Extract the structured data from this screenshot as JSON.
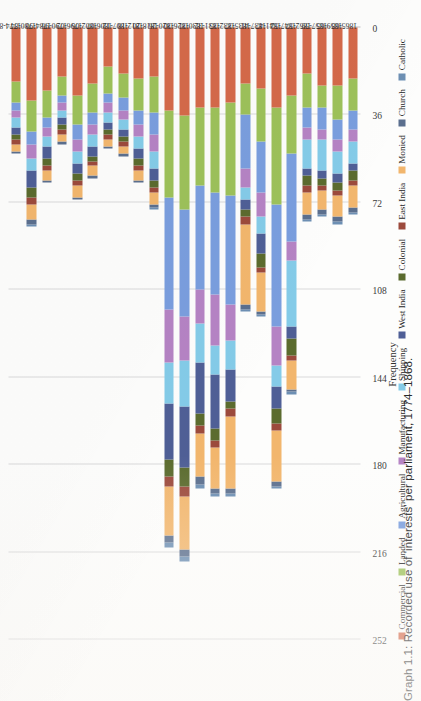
{
  "caption": "Graph 1.1: Recorded use of 'interests' per parliament, 1774–1868.",
  "chart_data": {
    "type": "bar",
    "subtype": "stacked-horizontal",
    "title": "",
    "xlabel": "",
    "ylabel": "Frequency",
    "orientation": "rotated-90",
    "grid": true,
    "legend_position": "bottom",
    "ylim": [
      0,
      252
    ],
    "yticks": [
      0,
      36,
      72,
      108,
      144,
      180,
      216,
      252
    ],
    "categories": [
      "1774-80",
      "1780-84",
      "1784-90",
      "1790-96",
      "1796-02",
      "1802-06",
      "1806-07",
      "1807-12",
      "1812-18",
      "1818-20",
      "1820-26",
      "1826-30",
      "1830-31",
      "1831-32",
      "1832-35",
      "1835-37",
      "1837-41",
      "1841-47",
      "1847-52",
      "1852-57",
      "1857-59",
      "1859-65",
      "1865-68"
    ],
    "series": [
      {
        "name": "Commercial",
        "color": "#d4694a",
        "values": [
          22,
          30,
          26,
          20,
          28,
          23,
          16,
          19,
          21,
          20,
          34,
          36,
          33,
          33,
          31,
          23,
          25,
          33,
          28,
          19,
          24,
          24,
          21
        ]
      },
      {
        "name": "Landed",
        "color": "#9dc15a",
        "values": [
          9,
          13,
          11,
          8,
          12,
          12,
          11,
          10,
          13,
          15,
          36,
          39,
          32,
          35,
          38,
          13,
          22,
          40,
          24,
          14,
          9,
          14,
          13
        ]
      },
      {
        "name": "Agricultural",
        "color": "#7a9ede",
        "values": [
          3,
          5,
          4,
          3,
          6,
          5,
          4,
          5,
          6,
          9,
          46,
          44,
          43,
          42,
          45,
          22,
          21,
          50,
          36,
          8,
          9,
          8,
          8
        ]
      },
      {
        "name": "Manufacturing",
        "color": "#b583c4",
        "values": [
          3,
          6,
          4,
          3,
          5,
          4,
          4,
          4,
          5,
          7,
          22,
          18,
          14,
          21,
          15,
          8,
          10,
          16,
          8,
          5,
          4,
          5,
          5
        ]
      },
      {
        "name": "Shipping",
        "color": "#84cbe8",
        "values": [
          4,
          5,
          4,
          3,
          5,
          5,
          4,
          4,
          5,
          7,
          17,
          19,
          16,
          12,
          12,
          5,
          7,
          9,
          27,
          12,
          13,
          9,
          9
        ]
      },
      {
        "name": "West India",
        "color": "#4f5f96",
        "values": [
          3,
          7,
          5,
          3,
          4,
          4,
          3,
          3,
          4,
          5,
          23,
          25,
          21,
          22,
          13,
          4,
          8,
          9,
          5,
          3,
          3,
          4,
          3
        ]
      },
      {
        "name": "Colonial",
        "color": "#5b6b2e",
        "values": [
          2,
          4,
          3,
          2,
          3,
          2,
          2,
          2,
          3,
          3,
          7,
          8,
          5,
          5,
          3,
          3,
          6,
          6,
          7,
          4,
          3,
          3,
          4
        ]
      },
      {
        "name": "East India",
        "color": "#9c4a3c",
        "values": [
          2,
          3,
          2,
          2,
          2,
          2,
          2,
          2,
          2,
          2,
          4,
          4,
          3,
          3,
          3,
          3,
          2,
          3,
          2,
          3,
          2,
          2,
          2
        ]
      },
      {
        "name": "Monied",
        "color": "#f2b66d",
        "values": [
          3,
          6,
          4,
          3,
          5,
          4,
          3,
          3,
          4,
          5,
          20,
          22,
          18,
          17,
          30,
          33,
          16,
          21,
          12,
          9,
          8,
          9,
          9
        ]
      },
      {
        "name": "Church",
        "color": "#5b6f8e",
        "values": [
          1,
          2,
          1,
          1,
          1,
          1,
          1,
          1,
          1,
          1,
          3,
          3,
          3,
          2,
          2,
          2,
          1,
          2,
          1,
          2,
          2,
          2,
          2
        ]
      },
      {
        "name": "Catholic",
        "color": "#6d8fb3",
        "values": [
          0,
          1,
          0,
          0,
          0,
          0,
          0,
          0,
          0,
          1,
          2,
          2,
          2,
          1,
          1,
          1,
          1,
          1,
          1,
          1,
          1,
          1,
          1
        ]
      }
    ]
  }
}
